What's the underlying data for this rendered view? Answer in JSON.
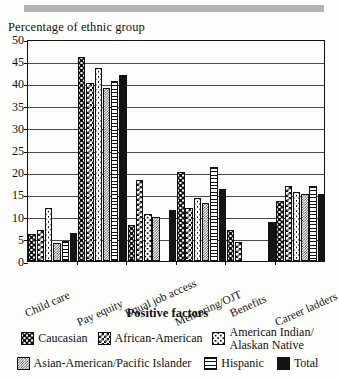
{
  "chart_data": {
    "type": "bar",
    "title": "",
    "ylabel": "Percentage of ethnic group",
    "xlabel": "Positive factors",
    "ylim": [
      0,
      50
    ],
    "yticks": [
      0,
      5,
      10,
      15,
      20,
      25,
      30,
      35,
      40,
      45,
      50
    ],
    "grid": true,
    "legend_position": "bottom",
    "categories": [
      "Child care",
      "Pay equity",
      "Equal job access",
      "Mentoring/OJT",
      "Benefits",
      "Career ladders"
    ],
    "series": [
      {
        "name": "Caucasian",
        "values": [
          6.0,
          46.0,
          8.0,
          20.0,
          7.0,
          13.5
        ]
      },
      {
        "name": "African-American",
        "values": [
          7.0,
          40.0,
          18.2,
          12.0,
          4.2,
          17.0
        ]
      },
      {
        "name": "American Indian/Alaskan Native",
        "values": [
          12.0,
          43.5,
          10.6,
          14.2,
          0.0,
          15.5
        ]
      },
      {
        "name": "Asian-American/Pacific Islander",
        "values": [
          4.0,
          39.0,
          10.0,
          13.0,
          0.0,
          15.2
        ]
      },
      {
        "name": "Hispanic",
        "values": [
          4.5,
          40.5,
          0.0,
          21.2,
          0.0,
          17.0
        ]
      },
      {
        "name": "Total",
        "values": [
          6.4,
          41.8,
          11.4,
          16.2,
          8.7,
          15.2
        ]
      }
    ]
  },
  "legend": {
    "title": "Positive factors",
    "items": [
      {
        "label": "Caucasian",
        "pattern": "dots-sparse"
      },
      {
        "label": "African-American",
        "pattern": "checker"
      },
      {
        "label": "American Indian/\nAlaskan Native",
        "pattern": "dots-fine"
      },
      {
        "label": "Asian-American/Pacific Islander",
        "pattern": "mesh"
      },
      {
        "label": "Hispanic",
        "pattern": "horizontal-lines"
      },
      {
        "label": "Total",
        "pattern": "solid-black"
      }
    ]
  },
  "colors": {
    "ink": "#111111",
    "paper": "#fdfdfb",
    "rule": "#b4b4b4",
    "grid": "#4a4a4a"
  }
}
